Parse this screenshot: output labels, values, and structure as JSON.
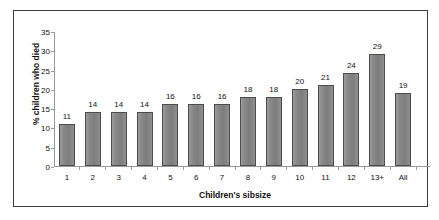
{
  "chart_data": {
    "type": "bar",
    "title": "",
    "xlabel": "Children's sibsize",
    "ylabel": "% children who died",
    "categories": [
      "1",
      "2",
      "3",
      "4",
      "5",
      "6",
      "7",
      "8",
      "9",
      "10",
      "11",
      "12",
      "13+",
      "All"
    ],
    "values": [
      11,
      14,
      14,
      14,
      16,
      16,
      16,
      18,
      18,
      20,
      21,
      24,
      29,
      19
    ],
    "ylim": [
      0,
      35
    ],
    "yticks": [
      0,
      5,
      10,
      15,
      20,
      25,
      30,
      35
    ],
    "grid": false,
    "legend": null,
    "bar_color": "#858585",
    "bar_border_color": "#4c4c4c",
    "axis_color": "#9a9a9a",
    "frame_color": "#3d3d3d",
    "background": "#ffffff"
  }
}
